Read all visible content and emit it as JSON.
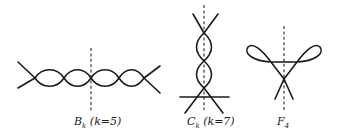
{
  "figures": [
    {
      "id": "B",
      "label": {
        "main": "B",
        "sub": "k",
        "suffix": " (k=5)"
      },
      "description": "Horizontal chain of lens-shaped regions crossed by a dashed vertical symmetry axis"
    },
    {
      "id": "C",
      "label": {
        "main": "C",
        "sub": "k",
        "suffix": " (k=7)"
      },
      "description": "Vertical chain of lens-shaped regions along a dashed vertical axis with a horizontal line near the bottom"
    },
    {
      "id": "F",
      "label": {
        "main": "F",
        "sub": "4",
        "suffix": ""
      },
      "description": "Two teardrop loops joined by a horizontal chord above a crossing, with a dashed vertical axis"
    }
  ],
  "colors": {
    "stroke": "#1a1a1a",
    "background": "#ffffff"
  }
}
